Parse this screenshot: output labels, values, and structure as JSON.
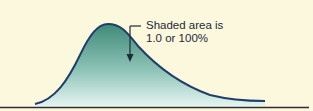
{
  "diagram": {
    "annotation": {
      "line1": "Shaded area is",
      "line2": "1.0 or 100%"
    },
    "colors": {
      "background": "#fbf8de",
      "curve_stroke": "#1f3f6a",
      "fill_top": "#3f8a78",
      "fill_bottom": "#e4f4f0",
      "baseline": "#2a2f36"
    }
  }
}
